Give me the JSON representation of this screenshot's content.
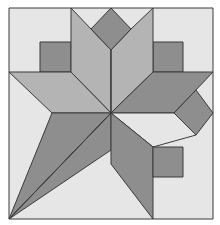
{
  "colors": {
    "background": "#ffffff",
    "light": "#e6e6e6",
    "medium": "#b4b4b4",
    "dark": "#8e8e8e",
    "stroke": "#3a3a3a"
  },
  "pieces": [
    {
      "name": "background-square",
      "tone": "light",
      "points": "9,8 213,8 213,219 9,219"
    },
    {
      "name": "top-left-small-square",
      "tone": "dark",
      "points": "40,42 71,42 71,72 40,72"
    },
    {
      "name": "top-right-small-square",
      "tone": "dark",
      "points": "153,42 183,42 183,72 153,72"
    },
    {
      "name": "top-left-petal",
      "tone": "medium",
      "points": "71,8 91,29 111,50 111,113 71,72"
    },
    {
      "name": "top-right-petal",
      "tone": "medium",
      "points": "153,8 131,29 111,50 111,113 153,72"
    },
    {
      "name": "top-diamond",
      "tone": "dark",
      "points": "111,8 131,29 111,50 91,29"
    },
    {
      "name": "left-leaf",
      "tone": "medium",
      "points": "9,72 71,72 111,113 52,113"
    },
    {
      "name": "right-leaf",
      "tone": "dark",
      "points": "153,72 213,72 174,113 111,113"
    },
    {
      "name": "right-diamond",
      "tone": "dark",
      "points": "174,113 196,90 213,113 196,135"
    },
    {
      "name": "right-lower-leaf",
      "tone": "light",
      "points": "111,113 174,113 196,135 153,147 "
    },
    {
      "name": "bottom-left-upper-blade",
      "tone": "dark",
      "points": "52,113 111,113 9,219"
    },
    {
      "name": "bottom-left-lower-blade",
      "tone": "dark",
      "points": "111,113 111,150 9,219"
    },
    {
      "name": "bottom-center-leaf",
      "tone": "dark",
      "points": "111,113 153,147 153,219 111,164"
    },
    {
      "name": "bottom-right-small-square",
      "tone": "dark",
      "points": "153,147 183,147 183,177 153,177"
    }
  ],
  "lines": [
    {
      "name": "center-diagonal",
      "points": "111,113 9,219"
    },
    {
      "name": "center-vertical",
      "points": "111,50 111,113"
    }
  ]
}
